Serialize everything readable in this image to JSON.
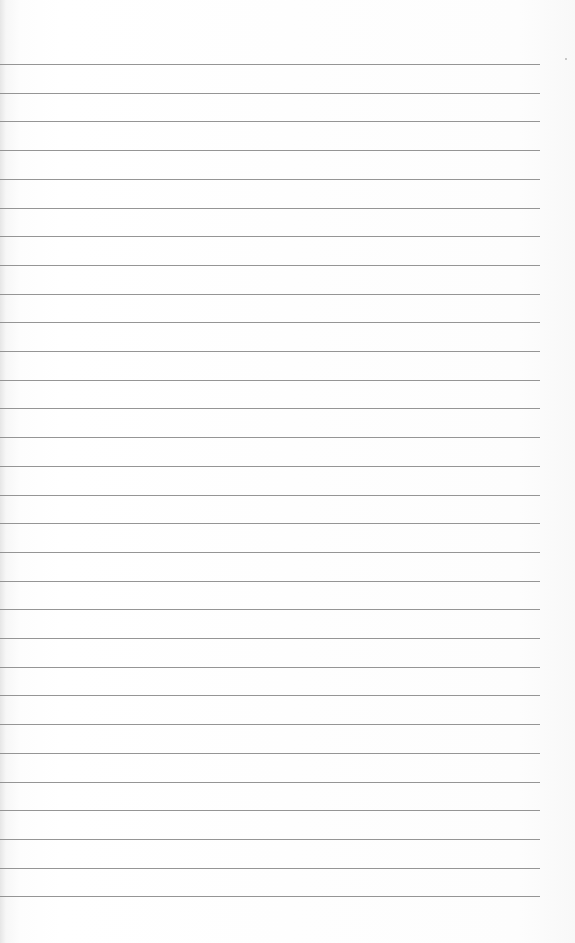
{
  "page": {
    "type": "blank lined paper",
    "line_count": 30,
    "line_color": "#8a8a8a",
    "paper_color": "#ffffff"
  }
}
